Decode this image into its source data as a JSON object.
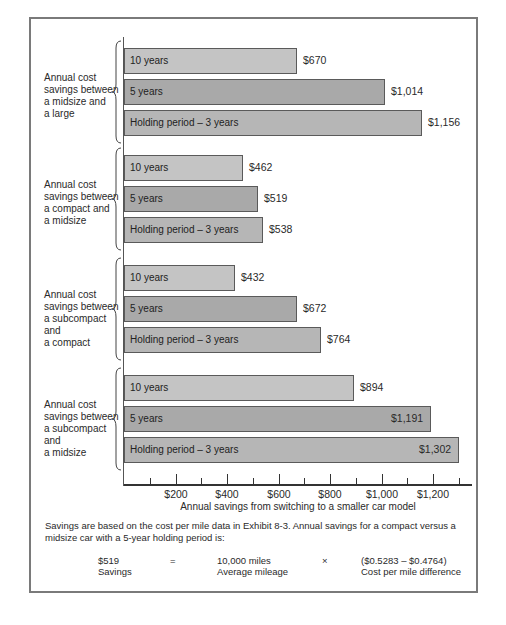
{
  "chart_data": {
    "type": "bar",
    "orientation": "horizontal",
    "title": "",
    "xlabel": "Annual savings from switching to a smaller car model",
    "ylabel": "",
    "xlim": [
      0,
      1350
    ],
    "x_ticks": [
      "$200",
      "$400",
      "$600",
      "$800",
      "$1,000",
      "$1,200"
    ],
    "grid": false,
    "legend": null,
    "groups": [
      {
        "label": "Annual cost savings between a midsize and a large",
        "categories": [
          "10 years",
          "5 years",
          "Holding period – 3 years"
        ],
        "values": [
          670,
          1014,
          1156
        ],
        "value_labels": [
          "$670",
          "$1,014",
          "$1,156"
        ]
      },
      {
        "label": "Annual cost savings between a compact and a midsize",
        "categories": [
          "10 years",
          "5 years",
          "Holding period – 3 years"
        ],
        "values": [
          462,
          519,
          538
        ],
        "value_labels": [
          "$462",
          "$519",
          "$538"
        ]
      },
      {
        "label": "Annual cost savings between a subcompact and a compact",
        "categories": [
          "10 years",
          "5 years",
          "Holding period – 3 years"
        ],
        "values": [
          432,
          672,
          764
        ],
        "value_labels": [
          "$432",
          "$672",
          "$764"
        ]
      },
      {
        "label": "Annual cost savings between a subcompact and a midsize",
        "categories": [
          "10 years",
          "5 years",
          "Holding period – 3 years"
        ],
        "values": [
          894,
          1191,
          1302
        ],
        "value_labels": [
          "$894",
          "$1,191",
          "$1,302"
        ]
      }
    ]
  },
  "groups": [
    {
      "label_lines": [
        "Annual cost",
        "savings between",
        "a midsize and",
        "a large"
      ],
      "bars": [
        {
          "label": "10 years",
          "value": "$670"
        },
        {
          "label": "5 years",
          "value": "$1,014"
        },
        {
          "label": "Holding period – 3 years",
          "value": "$1,156"
        }
      ]
    },
    {
      "label_lines": [
        "Annual cost",
        "savings between",
        "a compact and",
        "a midsize"
      ],
      "bars": [
        {
          "label": "10 years",
          "value": "$462"
        },
        {
          "label": "5 years",
          "value": "$519"
        },
        {
          "label": "Holding period – 3 years",
          "value": "$538"
        }
      ]
    },
    {
      "label_lines": [
        "Annual cost",
        "savings between",
        "a subcompact and",
        "a compact"
      ],
      "bars": [
        {
          "label": "10 years",
          "value": "$432"
        },
        {
          "label": "5 years",
          "value": "$672"
        },
        {
          "label": "Holding period – 3 years",
          "value": "$764"
        }
      ]
    },
    {
      "label_lines": [
        "Annual cost",
        "savings between",
        "a subcompact and",
        "a midsize"
      ],
      "bars": [
        {
          "label": "10 years",
          "value": "$894"
        },
        {
          "label": "5 years",
          "value": "$1,191"
        },
        {
          "label": "Holding period – 3 years",
          "value": "$1,302"
        }
      ]
    }
  ],
  "axis": {
    "ticks": [
      "$200",
      "$400",
      "$600",
      "$800",
      "$1,000",
      "$1,200"
    ],
    "label": "Annual savings from switching to a smaller car model"
  },
  "footnote": {
    "text": "Savings are based on the cost per mile data in Exhibit 8-3. Annual savings for a compact versus a midsize car with a 5-year holding period is:",
    "equation": {
      "savings_value": "$519",
      "savings_label": "Savings",
      "equals": "=",
      "mileage_value": "10,000 miles",
      "mileage_label": "Average mileage",
      "times": "×",
      "diff_value": "($0.5283 – $0.4764)",
      "diff_label": "Cost per mile difference"
    }
  },
  "colors": {
    "bar_10yr": "#c4c4c4",
    "bar_5yr": "#a9a9a9",
    "bar_3yr": "#b6b6b6",
    "frame": "#7a7a7a"
  }
}
